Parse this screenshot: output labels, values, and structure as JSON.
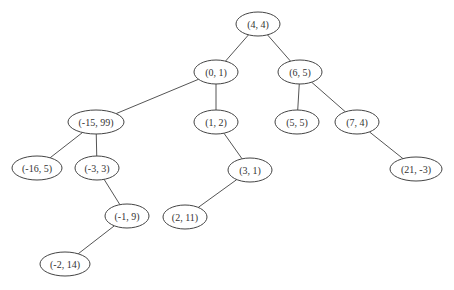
{
  "diagram": {
    "type": "binary-tree",
    "cutoff_header_text": "",
    "edge_color": "#555555",
    "node_stroke_color": "#444444",
    "nodes": [
      {
        "id": "n0",
        "label": "(4, 4)",
        "cx": 258,
        "cy": 24,
        "rx": 22,
        "ry": 12
      },
      {
        "id": "n1",
        "label": "(0, 1)",
        "cx": 216,
        "cy": 72,
        "rx": 22,
        "ry": 12
      },
      {
        "id": "n2",
        "label": "(6, 5)",
        "cx": 300,
        "cy": 72,
        "rx": 22,
        "ry": 12
      },
      {
        "id": "n3",
        "label": "(-15, 99)",
        "cx": 96,
        "cy": 122,
        "rx": 28,
        "ry": 12
      },
      {
        "id": "n4",
        "label": "(1, 2)",
        "cx": 216,
        "cy": 122,
        "rx": 22,
        "ry": 12
      },
      {
        "id": "n5",
        "label": "(5, 5)",
        "cx": 297,
        "cy": 122,
        "rx": 22,
        "ry": 12
      },
      {
        "id": "n6",
        "label": "(7, 4)",
        "cx": 357,
        "cy": 122,
        "rx": 22,
        "ry": 12
      },
      {
        "id": "n7",
        "label": "(-16, 5)",
        "cx": 37,
        "cy": 168,
        "rx": 25,
        "ry": 12
      },
      {
        "id": "n8",
        "label": "(-3, 3)",
        "cx": 97,
        "cy": 168,
        "rx": 22,
        "ry": 12
      },
      {
        "id": "n9",
        "label": "(3, 1)",
        "cx": 250,
        "cy": 170,
        "rx": 22,
        "ry": 12
      },
      {
        "id": "n10",
        "label": "(21, -3)",
        "cx": 416,
        "cy": 169,
        "rx": 26,
        "ry": 12
      },
      {
        "id": "n11",
        "label": "(-1, 9)",
        "cx": 127,
        "cy": 216,
        "rx": 22,
        "ry": 12
      },
      {
        "id": "n12",
        "label": "(2, 11)",
        "cx": 185,
        "cy": 217,
        "rx": 22,
        "ry": 12
      },
      {
        "id": "n13",
        "label": "(-2, 14)",
        "cx": 65,
        "cy": 264,
        "rx": 25,
        "ry": 12
      }
    ],
    "edges": [
      {
        "from": "n0",
        "to": "n1"
      },
      {
        "from": "n0",
        "to": "n2"
      },
      {
        "from": "n1",
        "to": "n3"
      },
      {
        "from": "n1",
        "to": "n4"
      },
      {
        "from": "n2",
        "to": "n5"
      },
      {
        "from": "n2",
        "to": "n6"
      },
      {
        "from": "n3",
        "to": "n7"
      },
      {
        "from": "n3",
        "to": "n8"
      },
      {
        "from": "n4",
        "to": "n9"
      },
      {
        "from": "n6",
        "to": "n10"
      },
      {
        "from": "n8",
        "to": "n11"
      },
      {
        "from": "n9",
        "to": "n12"
      },
      {
        "from": "n11",
        "to": "n13"
      }
    ]
  }
}
